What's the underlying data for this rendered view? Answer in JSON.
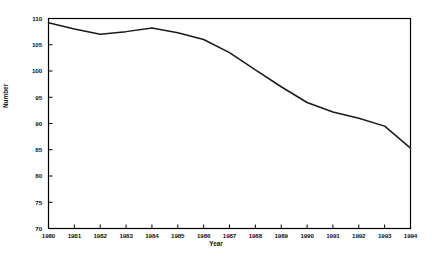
{
  "chart_data": {
    "type": "line",
    "title": "",
    "xlabel": "Year",
    "ylabel": "Number",
    "x": [
      1980,
      1981,
      1982,
      1983,
      1984,
      1985,
      1986,
      1987,
      1988,
      1989,
      1990,
      1991,
      1992,
      1993,
      1994
    ],
    "xtick_labels": [
      "1980",
      "1981",
      "1982",
      "1983",
      "1984",
      "1985",
      "1986",
      "1987",
      "1988",
      "1989",
      "1990",
      "1991",
      "1992",
      "1993",
      "1994"
    ],
    "values": [
      109.2,
      108.0,
      107.0,
      107.5,
      108.2,
      107.3,
      106.0,
      103.5,
      100.2,
      97.0,
      94.0,
      92.2,
      91.0,
      89.5,
      85.3
    ],
    "series": [
      {
        "name": "Number",
        "values": [
          109.2,
          108.0,
          107.0,
          107.5,
          108.2,
          107.3,
          106.0,
          103.5,
          100.2,
          97.0,
          94.0,
          92.2,
          91.0,
          89.5,
          85.3
        ]
      }
    ],
    "ylim": [
      70,
      110
    ],
    "xlim": [
      1980,
      1994
    ],
    "ytick_values": [
      70,
      75,
      80,
      85,
      90,
      95,
      100,
      105,
      110
    ],
    "ytick_labels": [
      "70",
      "75",
      "80",
      "85",
      "90",
      "95",
      "100",
      "105",
      "110"
    ],
    "grid": false,
    "legend": null,
    "legend_position": "none",
    "line_color": "#1a1a1a",
    "axis_color": "#000000",
    "background_color": "#ffffff"
  }
}
